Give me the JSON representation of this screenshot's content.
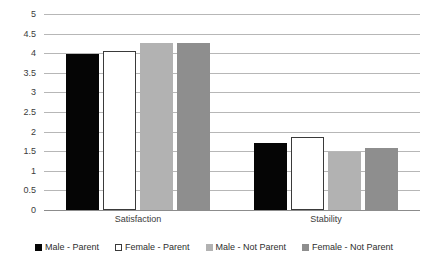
{
  "chart_data": {
    "type": "bar",
    "title": "",
    "subtitle": "",
    "xlabel": "",
    "ylabel": "",
    "categories": [
      "Satisfaction",
      "Stability"
    ],
    "series": [
      {
        "name": "Male - Parent",
        "color": "#050505",
        "values": [
          3.97,
          1.7
        ]
      },
      {
        "name": "Female - Parent",
        "color": "#ffffff",
        "values": [
          4.05,
          1.85
        ]
      },
      {
        "name": "Male - Not Parent",
        "color": "#b2b2b2",
        "values": [
          4.25,
          1.48
        ]
      },
      {
        "name": "Female - Not Parent",
        "color": "#8e8e8e",
        "values": [
          4.25,
          1.57
        ]
      }
    ],
    "ylim": [
      0,
      5
    ],
    "ytick_step": 0.5,
    "yticks": [
      "5",
      "4.5",
      "4",
      "3.5",
      "3",
      "2.5",
      "2",
      "1.5",
      "1",
      "0.5",
      "0"
    ],
    "grid": "horizontal",
    "legend_position": "bottom"
  },
  "axis": {
    "gridline_color": "#b7b7b7",
    "baseline_color": "#8c8c8c",
    "tick_text_color": "#3b3b3b"
  }
}
